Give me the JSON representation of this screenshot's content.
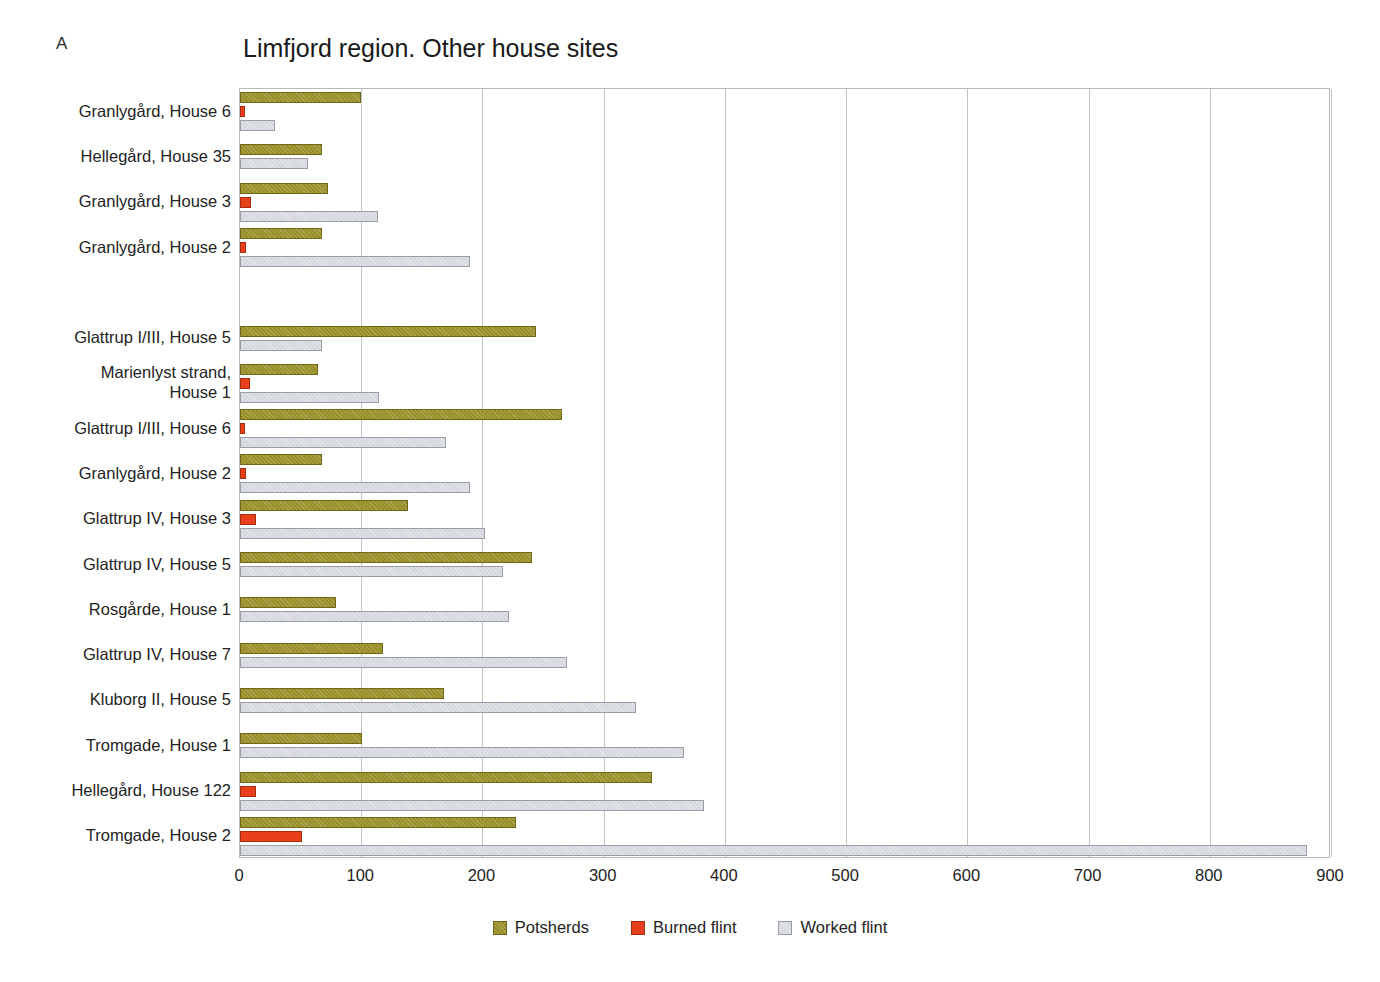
{
  "panel": {
    "label": "A"
  },
  "chart_data": {
    "type": "bar",
    "orientation": "horizontal",
    "title": "Limfjord region. Other house sites",
    "xlabel": "",
    "ylabel": "",
    "xlim": [
      0,
      900
    ],
    "xticks": [
      0,
      100,
      200,
      300,
      400,
      500,
      600,
      700,
      800,
      900
    ],
    "xtick_labels": [
      "0",
      "100",
      "200",
      "300",
      "400",
      "500",
      "600",
      "700",
      "800",
      "900"
    ],
    "grid": true,
    "grid_axis": "x",
    "legend_position": "bottom-center",
    "categories": [
      "Granlygård, House 6",
      "Hellegård, House 35",
      "Granlygård, House 3",
      "Granlygård, House 2",
      "",
      "Glattrup I/III, House 5",
      "Marienlyst strand,\nHouse 1",
      "Glattrup I/III, House 6",
      "Granlygård, House 2",
      "Glattrup IV, House 3",
      "Glattrup IV, House 5",
      "Rosgårde, House 1",
      "Glattrup IV, House 7",
      "Kluborg II, House 5",
      "Tromgade, House 1",
      "Hellegård, House 122",
      "Tromgade, House 2"
    ],
    "series": [
      {
        "name": "Potsherds",
        "color": "#9a9029",
        "values": [
          100,
          68,
          73,
          68,
          0,
          244,
          64,
          266,
          68,
          139,
          241,
          79,
          118,
          168,
          101,
          340,
          228
        ]
      },
      {
        "name": "Burned flint",
        "color": "#e8401a",
        "values": [
          4,
          0,
          9,
          5,
          0,
          0,
          8,
          4,
          5,
          13,
          0,
          0,
          0,
          0,
          0,
          13,
          51
        ]
      },
      {
        "name": "Worked flint",
        "color": "#d5d8de",
        "values": [
          29,
          56,
          114,
          190,
          0,
          68,
          115,
          170,
          190,
          202,
          217,
          222,
          270,
          327,
          366,
          383,
          880
        ]
      }
    ]
  },
  "legend": {
    "entries": [
      {
        "label": "Potsherds",
        "swatch": "potsherds"
      },
      {
        "label": "Burned flint",
        "swatch": "burned"
      },
      {
        "label": "Worked flint",
        "swatch": "worked"
      }
    ]
  }
}
